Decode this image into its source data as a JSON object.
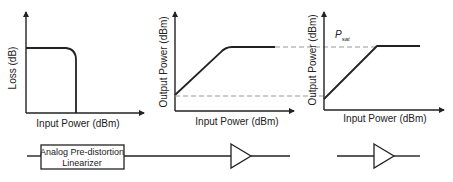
{
  "diagram": {
    "panels": [
      {
        "id": "linearizer-loss",
        "ylabel": "Loss (dB)",
        "xlabel": "Input Power (dBm)"
      },
      {
        "id": "linearized-output",
        "ylabel": "Output Power (dBm)",
        "xlabel": "Input Power (dBm)"
      },
      {
        "id": "amplifier-output",
        "ylabel": "Output Power (dBm)",
        "xlabel": "Input Power (dBm)",
        "annotation": "P",
        "annotation_sub": "sat"
      }
    ],
    "blocks": {
      "linearizer_line1": "Analog Pre-distortion",
      "linearizer_line2": "Linearizer",
      "amplifier_symbol": "amplifier",
      "standalone_amplifier_symbol": "amplifier"
    },
    "colors": {
      "line": "#222222",
      "dashed": "#999999",
      "background": "#ffffff"
    }
  }
}
